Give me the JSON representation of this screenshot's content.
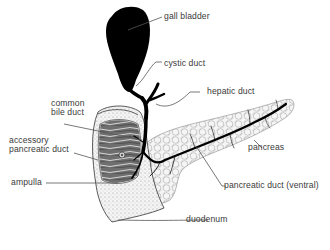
{
  "diagram": {
    "labels": {
      "gall_bladder": "gall bladder",
      "cystic_duct": "cystic duct",
      "common_bile_duct_line1": "common",
      "common_bile_duct_line2": "bile duct",
      "hepatic_duct": "hepatic duct",
      "accessory_pancreatic_duct_line1": "accessory",
      "accessory_pancreatic_duct_line2": "pancreatic duct",
      "ampulla": "ampulla",
      "pancreas": "pancreas",
      "pancreatic_duct_ventral": "pancreatic duct (ventral)",
      "duodenum": "duodenum"
    },
    "colors": {
      "background": "#ffffff",
      "ink": "#000000",
      "label_text": "#3a3a3a",
      "leader_line": "#555555",
      "duodenum_fill": "#e9e9e9",
      "duodenum_interior": "#8a8a8a",
      "pancreas_fill": "#ececec"
    }
  }
}
